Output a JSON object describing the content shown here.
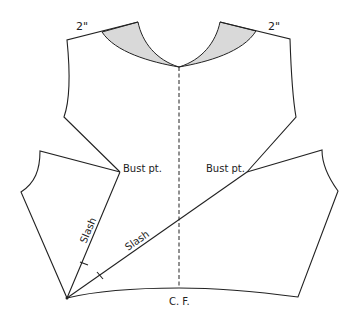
{
  "diagram": {
    "type": "sewing-pattern-bodice-slash",
    "labels": {
      "left_shoulder_measure": "2\"",
      "right_shoulder_measure": "2\"",
      "left_bust_point": "Bust pt.",
      "right_bust_point": "Bust pt.",
      "slash_vertical": "Slash",
      "slash_diagonal": "Slash",
      "center_front": "C. F."
    },
    "colors": {
      "line": "#222222",
      "neck_fill": "#d9d9d9",
      "background": "#ffffff"
    }
  }
}
